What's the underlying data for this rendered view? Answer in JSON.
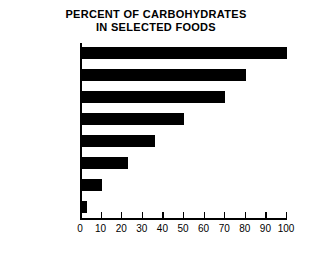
{
  "chart_data": {
    "type": "bar",
    "orientation": "horizontal",
    "title": "PERCENT OF CARBOHYDRATES IN SELECTED FOODS",
    "title_lines": [
      "PERCENT OF CARBOHYDRATES",
      "IN SELECTED FOODS"
    ],
    "categories": [
      "Sugar",
      "Marshmallows",
      "Cookies",
      "White bread",
      "Pancakes",
      "Cooked rice",
      "Grapefruit",
      "Cheese"
    ],
    "values": [
      100,
      80,
      70,
      50,
      36,
      23,
      10,
      3
    ],
    "xlabel": "",
    "ylabel": "",
    "xlim": [
      0,
      100
    ],
    "xticks": [
      0,
      10,
      20,
      30,
      40,
      50,
      60,
      70,
      80,
      90,
      100
    ],
    "xtick_labels": [
      "0",
      "10",
      "20",
      "30",
      "40",
      "50",
      "60",
      "70",
      "80",
      "90",
      "100"
    ],
    "grid": false,
    "legend": false,
    "bar_color": "#000000",
    "axis_color": "#000000",
    "background_color": "#ffffff"
  }
}
